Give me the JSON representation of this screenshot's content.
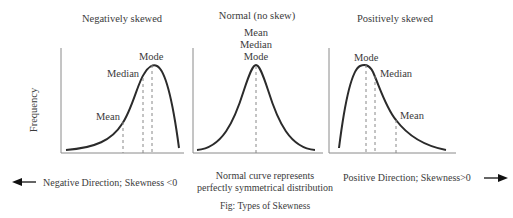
{
  "panels": [
    {
      "title": "Negatively skewed",
      "labels": {
        "mode": "Mode",
        "median": "Median",
        "mean": "Mean"
      }
    },
    {
      "title": "Normal (no skew)",
      "labels": {
        "mean": "Mean",
        "median": "Median",
        "mode": "Mode"
      }
    },
    {
      "title": "Positively skewed",
      "labels": {
        "mode": "Mode",
        "median": "Median",
        "mean": "Mean"
      }
    }
  ],
  "y_axis_label": "Frequency",
  "bottom": {
    "negative": "Negative Direction;  Skewness <0",
    "normal_line1": "Normal curve represents",
    "normal_line2": "perfectly symmetrical  distribution",
    "positive": "Positive Direction; Skewness>0"
  },
  "caption": "Fig: Types of Skewness",
  "colors": {
    "curve": "#2b2b2b",
    "axis": "#8a8a8a",
    "dash": "#888888",
    "text": "#3b3b3b"
  }
}
